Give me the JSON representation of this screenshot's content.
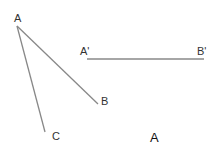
{
  "diagram": {
    "labels": {
      "A": "A",
      "B": "B",
      "C": "C",
      "A_prime": "A'",
      "B_prime": "B'",
      "caption": "A"
    },
    "colors": {
      "line": "#888888",
      "text": "#333333"
    },
    "segments": [
      {
        "name": "AB",
        "from": [
          17,
          26
        ],
        "to": [
          98,
          104
        ]
      },
      {
        "name": "AC",
        "from": [
          17,
          26
        ],
        "to": [
          45,
          132
        ]
      },
      {
        "name": "A'B'",
        "from": [
          87,
          59
        ],
        "to": [
          204,
          59
        ]
      }
    ]
  }
}
